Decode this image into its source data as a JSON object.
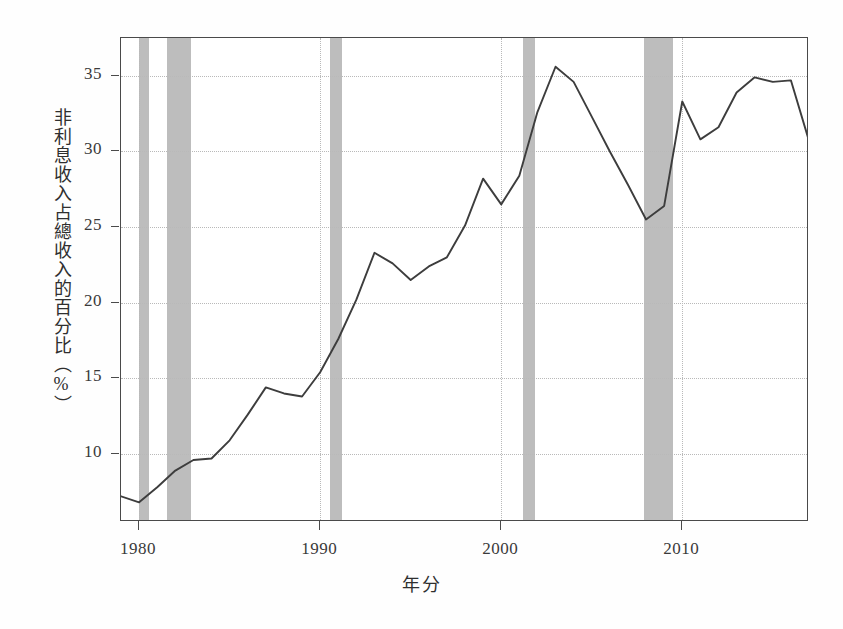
{
  "chart_data": {
    "type": "line",
    "title": "",
    "subtitle": "",
    "xlabel": "年分",
    "ylabel": "非利息收入占總收入的百分比（%）",
    "xlim": [
      1979,
      2017
    ],
    "ylim": [
      5.5,
      37.5
    ],
    "xticks": [
      1980,
      1990,
      2000,
      2010
    ],
    "xtick_labels": [
      "1980",
      "1990",
      "2000",
      "2010"
    ],
    "yticks": [
      10,
      15,
      20,
      25,
      30,
      35
    ],
    "ytick_labels": [
      "10",
      "15",
      "20",
      "25",
      "30",
      "35"
    ],
    "grid": true,
    "legend": "none",
    "line_color": "#3d3d3d",
    "band_color": "#b7b7b7",
    "series": [
      {
        "name": "非利息收入占總收入的百分比",
        "x": [
          1979,
          1980,
          1981,
          1982,
          1983,
          1984,
          1985,
          1986,
          1987,
          1988,
          1989,
          1990,
          1991,
          1992,
          1993,
          1994,
          1995,
          1996,
          1997,
          1998,
          1999,
          2000,
          2001,
          2002,
          2003,
          2004,
          2005,
          2006,
          2007,
          2008,
          2009,
          2010,
          2011,
          2012,
          2013,
          2014,
          2015,
          2016,
          2017
        ],
        "values": [
          7.2,
          6.8,
          7.8,
          8.9,
          9.6,
          9.7,
          10.9,
          12.6,
          14.4,
          14.0,
          13.8,
          15.4,
          17.6,
          20.2,
          23.3,
          22.6,
          21.5,
          22.4,
          23.0,
          25.1,
          28.2,
          26.5,
          28.4,
          32.6,
          35.6,
          34.6,
          32.3,
          30.0,
          27.8,
          25.5,
          26.4,
          33.3,
          30.8,
          31.6,
          33.9,
          34.9,
          34.6,
          34.7,
          30.7
        ]
      }
    ],
    "recession_bands": [
      {
        "label": "1980 衰退",
        "start": 1980.0,
        "end": 1980.55
      },
      {
        "label": "1981-1982 衰退",
        "start": 1981.55,
        "end": 1982.85
      },
      {
        "label": "1990-1991 衰退",
        "start": 1990.55,
        "end": 1991.2
      },
      {
        "label": "2001 衰退",
        "start": 2001.2,
        "end": 2001.85
      },
      {
        "label": "2007-2009 衰退",
        "start": 2007.9,
        "end": 2009.5
      }
    ]
  },
  "axis": {
    "y_label_text": "非利息收入占總收入的百分比（%）",
    "x_label_text": "年分"
  }
}
